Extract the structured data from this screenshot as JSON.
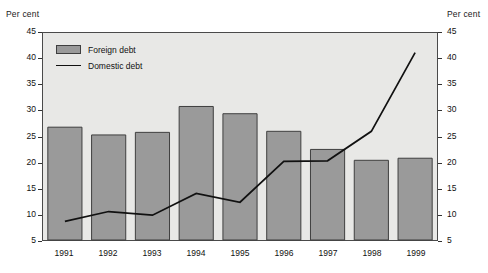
{
  "chart_data": {
    "type": "bar",
    "title": "",
    "subtitle": "",
    "xlabel": "",
    "ylabel": "Per cent",
    "ylabel_right": "Per cent",
    "categories": [
      "1991",
      "1992",
      "1993",
      "1994",
      "1995",
      "1996",
      "1997",
      "1998",
      "1999"
    ],
    "ylim": [
      5,
      45
    ],
    "yticks": [
      5,
      10,
      15,
      20,
      25,
      30,
      35,
      40,
      45
    ],
    "ytick_labels": [
      "5",
      "10",
      "15",
      "20",
      "25",
      "30",
      "35",
      "40",
      "45"
    ],
    "grid": false,
    "legend_position": "top-left",
    "series": [
      {
        "name": "Foreign debt",
        "kind": "bar",
        "color": "#9a9a9a",
        "edge_color": "#3f3f3f",
        "values": [
          26.8,
          25.3,
          25.8,
          30.8,
          29.4,
          26.0,
          22.5,
          20.4,
          20.8
        ]
      },
      {
        "name": "Domestic debt",
        "kind": "line",
        "color": "#111111",
        "values": [
          8.6,
          10.5,
          9.8,
          14.0,
          12.3,
          20.2,
          20.3,
          26.0,
          41.2
        ]
      }
    ]
  },
  "legend": {
    "items": [
      {
        "label": "Foreign debt",
        "marker": "bar-swatch"
      },
      {
        "label": "Domestic debt",
        "marker": "line-swatch"
      }
    ]
  },
  "axes": {
    "left_unit": "Per cent",
    "right_unit": "Per cent"
  }
}
